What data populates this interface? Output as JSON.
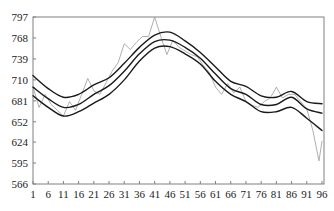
{
  "chart_data": {
    "type": "line",
    "title": "",
    "xlabel": "",
    "ylabel": "",
    "xlim": [
      1,
      96
    ],
    "ylim": [
      566,
      797
    ],
    "grid": false,
    "legend": "none",
    "x_ticks": [
      1,
      6,
      11,
      16,
      21,
      26,
      31,
      36,
      41,
      46,
      51,
      56,
      61,
      66,
      71,
      76,
      81,
      86,
      91,
      96
    ],
    "y_ticks": [
      797,
      768,
      739,
      710,
      681,
      652,
      624,
      595,
      566
    ],
    "series": [
      {
        "name": "actual",
        "color": "#9a9a9a",
        "width": 0.8,
        "x": [
          1,
          3,
          5,
          7,
          9,
          11,
          13,
          15,
          17,
          19,
          21,
          23,
          25,
          27,
          29,
          31,
          33,
          35,
          37,
          39,
          41,
          43,
          45,
          47,
          49,
          51,
          53,
          55,
          57,
          59,
          61,
          63,
          65,
          67,
          69,
          71,
          73,
          75,
          77,
          79,
          81,
          83,
          85,
          87,
          89,
          91,
          93,
          95,
          96
        ],
        "values": [
          700,
          672,
          690,
          676,
          668,
          660,
          680,
          668,
          690,
          712,
          695,
          690,
          706,
          722,
          734,
          760,
          752,
          762,
          770,
          770,
          797,
          770,
          745,
          765,
          755,
          750,
          745,
          742,
          730,
          720,
          700,
          690,
          705,
          692,
          700,
          680,
          675,
          672,
          680,
          685,
          700,
          685,
          690,
          690,
          680,
          670,
          640,
          598,
          625
        ]
      },
      {
        "name": "upper",
        "color": "#1a1a1a",
        "width": 1.4,
        "x": [
          1,
          6,
          11,
          16,
          21,
          26,
          31,
          36,
          41,
          46,
          51,
          56,
          61,
          66,
          71,
          76,
          81,
          86,
          91,
          96
        ],
        "values": [
          716,
          698,
          686,
          690,
          703,
          713,
          733,
          755,
          772,
          776,
          764,
          748,
          728,
          708,
          701,
          688,
          686,
          694,
          680,
          677
        ]
      },
      {
        "name": "middle",
        "color": "#1a1a1a",
        "width": 1.4,
        "x": [
          1,
          6,
          11,
          16,
          21,
          26,
          31,
          36,
          41,
          46,
          51,
          56,
          61,
          66,
          71,
          76,
          81,
          86,
          91,
          96
        ],
        "values": [
          700,
          684,
          672,
          676,
          690,
          702,
          722,
          746,
          763,
          765,
          755,
          740,
          718,
          698,
          690,
          676,
          676,
          686,
          670,
          664
        ]
      },
      {
        "name": "lower",
        "color": "#1a1a1a",
        "width": 1.4,
        "x": [
          1,
          6,
          11,
          16,
          21,
          26,
          31,
          36,
          41,
          46,
          51,
          56,
          61,
          66,
          71,
          76,
          81,
          86,
          91,
          96
        ],
        "values": [
          688,
          672,
          660,
          666,
          678,
          690,
          710,
          736,
          754,
          756,
          746,
          732,
          708,
          690,
          680,
          666,
          666,
          672,
          657,
          640
        ]
      }
    ]
  },
  "colors": {
    "axis": "#808080",
    "text": "#222222",
    "background": "#ffffff"
  }
}
